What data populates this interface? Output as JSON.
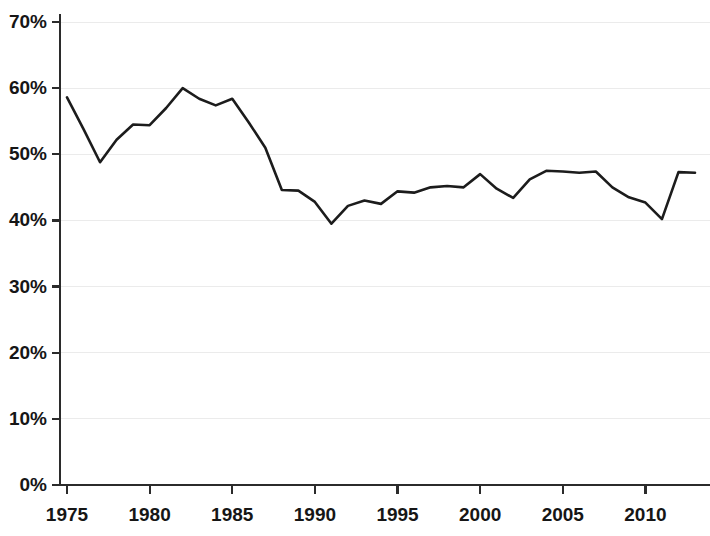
{
  "chart_data": {
    "type": "line",
    "title": "",
    "subtitle": "",
    "xlabel": "",
    "ylabel": "",
    "xlim": [
      1975,
      2013
    ],
    "ylim": [
      0,
      70
    ],
    "grid": true,
    "legend": false,
    "legend_position": "none",
    "line_color": "#1c1c1c",
    "grid_color": "#ebebeb",
    "axis_color": "#2b2b2b",
    "y_tick_labels": [
      "0%",
      "10%",
      "20%",
      "30%",
      "40%",
      "50%",
      "60%",
      "70%"
    ],
    "y_tick_values": [
      0,
      10,
      20,
      30,
      40,
      50,
      60,
      70
    ],
    "x_tick_labels": [
      "1975",
      "1980",
      "1985",
      "1990",
      "1995",
      "2000",
      "2005",
      "2010"
    ],
    "x_tick_values": [
      1975,
      1980,
      1985,
      1990,
      1995,
      2000,
      2005,
      2010
    ],
    "x": [
      1975,
      1976,
      1977,
      1978,
      1979,
      1980,
      1981,
      1982,
      1983,
      1984,
      1985,
      1986,
      1987,
      1988,
      1989,
      1990,
      1991,
      1992,
      1993,
      1994,
      1995,
      1996,
      1997,
      1998,
      1999,
      2000,
      2001,
      2002,
      2003,
      2004,
      2005,
      2006,
      2007,
      2008,
      2009,
      2010,
      2011,
      2012,
      2013
    ],
    "values": [
      58.6,
      53.8,
      48.8,
      52.2,
      54.5,
      54.4,
      57.0,
      60.0,
      58.4,
      57.4,
      58.4,
      54.8,
      51.0,
      44.6,
      44.5,
      42.8,
      39.5,
      42.2,
      43.0,
      42.5,
      44.4,
      44.2,
      45.0,
      45.2,
      45.0,
      47.0,
      44.8,
      43.4,
      46.2,
      47.5,
      47.4,
      47.2,
      47.4,
      45.0,
      43.5,
      42.7,
      40.2,
      47.3,
      47.2
    ],
    "series": [
      {
        "name": "",
        "values": [
          58.6,
          53.8,
          48.8,
          52.2,
          54.5,
          54.4,
          57.0,
          60.0,
          58.4,
          57.4,
          58.4,
          54.8,
          51.0,
          44.6,
          44.5,
          42.8,
          39.5,
          42.2,
          43.0,
          42.5,
          44.4,
          44.2,
          45.0,
          45.2,
          45.0,
          47.0,
          44.8,
          43.4,
          46.2,
          47.5,
          47.4,
          47.2,
          47.4,
          45.0,
          43.5,
          42.7,
          40.2,
          47.3,
          47.2
        ]
      }
    ],
    "annotations": []
  }
}
